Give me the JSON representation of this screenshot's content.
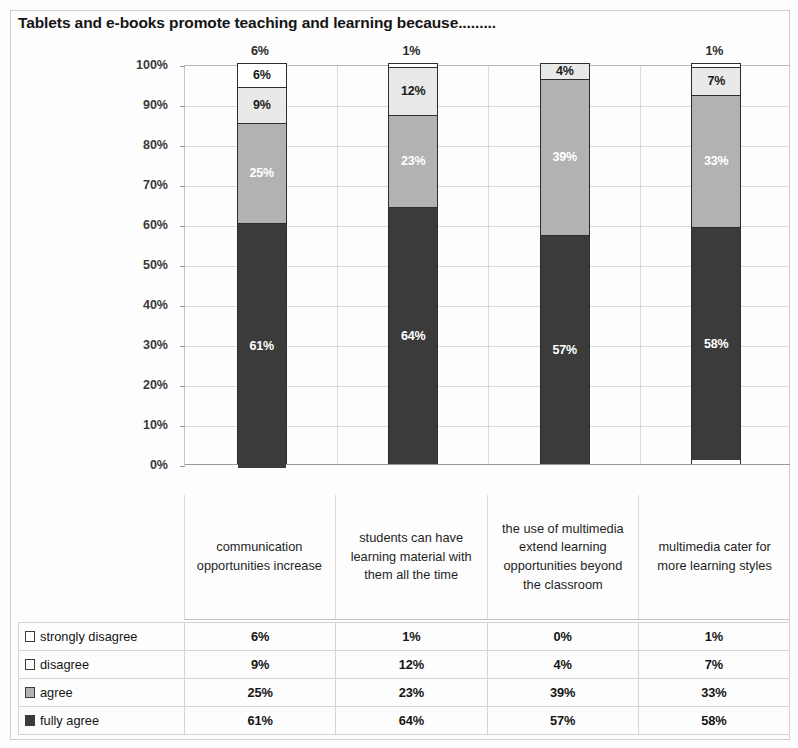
{
  "title": "Tablets and e-books promote teaching and learning because.........",
  "chart_data": {
    "type": "bar",
    "subtype": "stacked-column-100",
    "title": "Tablets and e-books promote teaching and learning because.........",
    "xlabel": "",
    "ylabel": "",
    "ylim": [
      0,
      100
    ],
    "ytick_labels": [
      "100%",
      "90%",
      "80%",
      "70%",
      "60%",
      "50%",
      "40%",
      "30%",
      "20%",
      "10%",
      "0%"
    ],
    "ytick_values": [
      100,
      90,
      80,
      70,
      60,
      50,
      40,
      30,
      20,
      10,
      0
    ],
    "grid": true,
    "legend_position": "table-below",
    "categories": [
      "communication opportunities increase",
      "students can have learning material with them all the time",
      "the use of multimedia extend learning opportunities beyond the classroom",
      "multimedia cater for more learning styles"
    ],
    "series": [
      {
        "name": "fully agree",
        "color": "#3b3b3b",
        "values": [
          61,
          64,
          57,
          58
        ],
        "labels": [
          "61%",
          "64%",
          "57%",
          "58%"
        ]
      },
      {
        "name": "agree",
        "color": "#b2b2b2",
        "values": [
          25,
          23,
          39,
          33
        ],
        "labels": [
          "25%",
          "23%",
          "39%",
          "33%"
        ]
      },
      {
        "name": "disagree",
        "color": "#e9e9e9",
        "values": [
          9,
          12,
          4,
          7
        ],
        "labels": [
          "9%",
          "12%",
          "4%",
          "7%"
        ]
      },
      {
        "name": "strongly disagree",
        "color": "#ffffff",
        "values": [
          6,
          1,
          0,
          1
        ],
        "labels": [
          "6%",
          "1%",
          "",
          "1%"
        ]
      }
    ],
    "top_labels": [
      "6%",
      "1%",
      "",
      "1%"
    ]
  },
  "table": {
    "rows": [
      {
        "key": "strongly disagree",
        "swatch": "white-square-icon",
        "values": [
          "6%",
          "1%",
          "0%",
          "1%"
        ]
      },
      {
        "key": "disagree",
        "swatch": "light-square-icon",
        "values": [
          "9%",
          "12%",
          "4%",
          "7%"
        ]
      },
      {
        "key": "agree",
        "swatch": "gray-square-icon",
        "values": [
          "25%",
          "23%",
          "39%",
          "33%"
        ]
      },
      {
        "key": "fully agree",
        "swatch": "dark-square-icon",
        "values": [
          "61%",
          "64%",
          "57%",
          "58%"
        ]
      }
    ]
  }
}
